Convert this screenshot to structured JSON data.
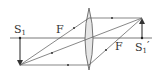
{
  "diagram": {
    "type": "convex-lens-ray-diagram",
    "labels": {
      "object": "S",
      "object_sub": "1",
      "image": "S",
      "image_sub": "1",
      "image_prime": "′",
      "focus_left": "F",
      "focus_right": "F"
    },
    "colors": {
      "line": "#444444",
      "lens_fill": "#e6e6e6",
      "lens_stroke": "#555555",
      "background": "#ffffff"
    }
  }
}
